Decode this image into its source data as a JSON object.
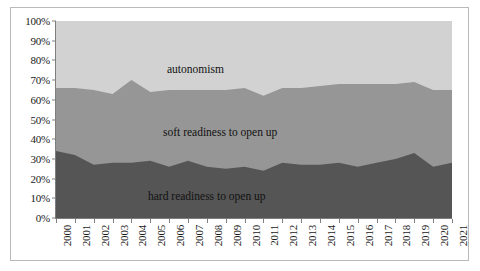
{
  "chart_data": {
    "type": "area",
    "stacked": true,
    "normalized_percent": true,
    "title": "",
    "subtitle": "",
    "xlabel": "",
    "ylabel": "",
    "ylim": [
      0,
      100
    ],
    "ytick_labels": [
      "0%",
      "10%",
      "20%",
      "30%",
      "40%",
      "50%",
      "60%",
      "70%",
      "80%",
      "90%",
      "100%"
    ],
    "ytick_values": [
      0,
      10,
      20,
      30,
      40,
      50,
      60,
      70,
      80,
      90,
      100
    ],
    "grid": "vertical",
    "legend_position": "inline-annotations",
    "categories": [
      "2000",
      "2001",
      "2002",
      "2003",
      "2004",
      "2005",
      "2006",
      "2007",
      "2008",
      "2009",
      "2010",
      "2011",
      "2012",
      "2013",
      "2014",
      "2015",
      "2016",
      "2017",
      "2018",
      "2019",
      "2020",
      "2021"
    ],
    "series": [
      {
        "name": "hard readiness to open up",
        "color": "#555555",
        "values": [
          34,
          32,
          27,
          28,
          28,
          29,
          26,
          29,
          26,
          25,
          26,
          24,
          28,
          27,
          27,
          28,
          26,
          28,
          30,
          33,
          26,
          28
        ]
      },
      {
        "name": "soft readiness to open up",
        "color": "#969696",
        "values": [
          32,
          34,
          38,
          35,
          42,
          35,
          39,
          36,
          39,
          40,
          40,
          38,
          38,
          39,
          40,
          40,
          42,
          40,
          38,
          36,
          39,
          37
        ]
      },
      {
        "name": "autonomism",
        "color": "#d2d2d2",
        "values": [
          34,
          34,
          35,
          37,
          30,
          36,
          35,
          35,
          35,
          35,
          34,
          38,
          34,
          34,
          33,
          32,
          32,
          32,
          32,
          31,
          35,
          35
        ]
      }
    ],
    "annotations": [
      {
        "name": "autonomism",
        "text": "autonomism"
      },
      {
        "name": "soft-readiness",
        "text": "soft readiness to open up"
      },
      {
        "name": "hard-readiness",
        "text": "hard readiness to open up"
      }
    ],
    "colors": {
      "autonomism": "#d2d2d2",
      "soft_readiness": "#969696",
      "hard_readiness": "#555555",
      "axis": "#7d7d7d",
      "gridline": "#8f8f8f",
      "frame": "#b9b9b9",
      "text": "#1a1a1a",
      "background": "#ffffff"
    }
  }
}
